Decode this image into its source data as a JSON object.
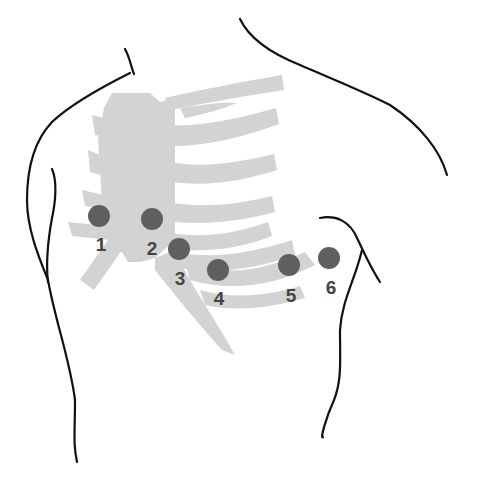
{
  "diagram": {
    "colors": {
      "outline": "#111111",
      "ribcage": "#d3d3d3",
      "electrode": "#5f5f5f",
      "label": "#444444",
      "background": "#ffffff"
    },
    "electrodes": [
      {
        "label": "1",
        "cx": 99,
        "cy": 216,
        "lx": 101,
        "ly": 251
      },
      {
        "label": "2",
        "cx": 152,
        "cy": 219,
        "lx": 152,
        "ly": 255
      },
      {
        "label": "3",
        "cx": 179,
        "cy": 249,
        "lx": 180,
        "ly": 285
      },
      {
        "label": "4",
        "cx": 218,
        "cy": 270,
        "lx": 219,
        "ly": 305
      },
      {
        "label": "5",
        "cx": 289,
        "cy": 265,
        "lx": 291,
        "ly": 302
      },
      {
        "label": "6",
        "cx": 329,
        "cy": 258,
        "lx": 331,
        "ly": 294
      }
    ]
  }
}
